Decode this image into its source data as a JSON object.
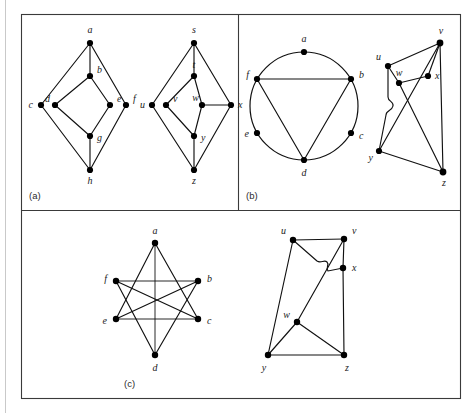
{
  "figure": {
    "panels": [
      {
        "id": "a",
        "label": "(a)"
      },
      {
        "id": "b",
        "label": "(b)"
      },
      {
        "id": "c",
        "label": "(c)"
      }
    ]
  },
  "panel_a": {
    "label": "(a)",
    "left_graph": {
      "name": "graph-a-left",
      "vertex_labels": [
        "a",
        "b",
        "c",
        "d",
        "e",
        "f",
        "g",
        "h"
      ],
      "vertices": [
        {
          "id": "a",
          "label": "a",
          "x": 90,
          "y": 43,
          "lx": 90,
          "ly": 33,
          "anchor": "middle"
        },
        {
          "id": "b",
          "label": "b",
          "x": 90,
          "y": 76,
          "lx": 97,
          "ly": 73,
          "anchor": "start"
        },
        {
          "id": "c",
          "label": "c",
          "x": 41,
          "y": 105,
          "lx": 33,
          "ly": 108,
          "anchor": "end"
        },
        {
          "id": "d",
          "label": "d",
          "x": 55,
          "y": 105,
          "lx": 48,
          "ly": 103,
          "anchor": "end"
        },
        {
          "id": "e",
          "label": "e",
          "x": 110,
          "y": 105,
          "lx": 117,
          "ly": 103,
          "anchor": "start"
        },
        {
          "id": "f",
          "label": "f",
          "x": 126,
          "y": 105,
          "lx": 133,
          "ly": 103,
          "anchor": "start"
        },
        {
          "id": "g",
          "label": "g",
          "x": 90,
          "y": 136,
          "lx": 97,
          "ly": 139,
          "anchor": "start"
        },
        {
          "id": "h",
          "label": "h",
          "x": 90,
          "y": 170,
          "lx": 90,
          "ly": 183,
          "anchor": "middle"
        }
      ],
      "edges": [
        [
          "a",
          "b"
        ],
        [
          "a",
          "c"
        ],
        [
          "a",
          "f"
        ],
        [
          "b",
          "d"
        ],
        [
          "b",
          "e"
        ],
        [
          "c",
          "h"
        ],
        [
          "f",
          "h"
        ],
        [
          "d",
          "g"
        ],
        [
          "e",
          "g"
        ],
        [
          "g",
          "h"
        ]
      ]
    },
    "right_graph": {
      "name": "graph-a-right",
      "vertex_labels": [
        "s",
        "t",
        "u",
        "v",
        "w",
        "x",
        "y",
        "z"
      ],
      "vertices": [
        {
          "id": "s",
          "label": "s",
          "x": 194,
          "y": 43,
          "lx": 194,
          "ly": 33,
          "anchor": "middle"
        },
        {
          "id": "t",
          "label": "t",
          "x": 194,
          "y": 76,
          "lx": 194,
          "ly": 68,
          "anchor": "middle"
        },
        {
          "id": "u",
          "label": "u",
          "x": 152,
          "y": 105,
          "lx": 144,
          "ly": 108,
          "anchor": "end"
        },
        {
          "id": "v",
          "label": "v",
          "x": 166,
          "y": 105,
          "lx": 173,
          "ly": 103,
          "anchor": "start"
        },
        {
          "id": "w",
          "label": "w",
          "x": 202,
          "y": 105,
          "lx": 199,
          "ly": 103,
          "anchor": "end"
        },
        {
          "id": "x",
          "label": "x",
          "x": 231,
          "y": 105,
          "lx": 238,
          "ly": 108,
          "anchor": "start"
        },
        {
          "id": "y",
          "label": "y",
          "x": 194,
          "y": 136,
          "lx": 201,
          "ly": 139,
          "anchor": "start"
        },
        {
          "id": "z",
          "label": "z",
          "x": 194,
          "y": 170,
          "lx": 194,
          "ly": 183,
          "anchor": "middle"
        }
      ],
      "edges": [
        [
          "s",
          "t"
        ],
        [
          "s",
          "u"
        ],
        [
          "s",
          "x"
        ],
        [
          "t",
          "v"
        ],
        [
          "t",
          "w"
        ],
        [
          "u",
          "z"
        ],
        [
          "x",
          "z"
        ],
        [
          "v",
          "y"
        ],
        [
          "w",
          "y"
        ],
        [
          "w",
          "x"
        ],
        [
          "y",
          "z"
        ]
      ]
    }
  },
  "panel_b": {
    "label": "(b)",
    "left_graph": {
      "name": "graph-b-left-circle",
      "shape": "circle",
      "circle": {
        "cx": 304,
        "cy": 106,
        "r": 54
      },
      "vertex_labels": [
        "a",
        "b",
        "c",
        "d",
        "e",
        "f"
      ],
      "vertices": [
        {
          "id": "a",
          "label": "a",
          "x": 304,
          "y": 52,
          "lx": 304,
          "ly": 43,
          "anchor": "middle"
        },
        {
          "id": "b",
          "label": "b",
          "x": 351,
          "y": 79,
          "lx": 359,
          "ly": 79,
          "anchor": "start"
        },
        {
          "id": "c",
          "label": "c",
          "x": 351,
          "y": 133,
          "lx": 359,
          "ly": 138,
          "anchor": "start"
        },
        {
          "id": "d",
          "label": "d",
          "x": 304,
          "y": 160,
          "lx": 304,
          "ly": 174,
          "anchor": "middle"
        },
        {
          "id": "e",
          "label": "e",
          "x": 257,
          "y": 133,
          "lx": 249,
          "ly": 136,
          "anchor": "end"
        },
        {
          "id": "f",
          "label": "f",
          "x": 257,
          "y": 79,
          "lx": 249,
          "ly": 79,
          "anchor": "end"
        }
      ],
      "edges": [
        [
          "f",
          "b"
        ],
        [
          "f",
          "d"
        ],
        [
          "b",
          "d"
        ]
      ]
    },
    "right_graph": {
      "name": "graph-b-right",
      "vertex_labels": [
        "u",
        "v",
        "w",
        "x",
        "y",
        "z"
      ],
      "vertices": [
        {
          "id": "u",
          "label": "u",
          "x": 388,
          "y": 66,
          "lx": 381,
          "ly": 60,
          "anchor": "end"
        },
        {
          "id": "v",
          "label": "v",
          "x": 440,
          "y": 43,
          "lx": 440,
          "ly": 34,
          "anchor": "middle"
        },
        {
          "id": "w",
          "label": "w",
          "x": 399,
          "y": 83,
          "lx": 398,
          "ly": 75,
          "anchor": "middle"
        },
        {
          "id": "x",
          "label": "x",
          "x": 428,
          "y": 76,
          "lx": 435,
          "ly": 79,
          "anchor": "start"
        },
        {
          "id": "y",
          "label": "y",
          "x": 379,
          "y": 151,
          "lx": 372,
          "ly": 158,
          "anchor": "end"
        },
        {
          "id": "z",
          "label": "z",
          "x": 443,
          "y": 172,
          "lx": 443,
          "ly": 185,
          "anchor": "middle"
        }
      ],
      "edges": [
        [
          "u",
          "v"
        ],
        [
          "u",
          "w"
        ],
        [
          "u",
          "y"
        ],
        [
          "v",
          "x"
        ],
        [
          "v",
          "z"
        ],
        [
          "v",
          "y"
        ],
        [
          "w",
          "x"
        ],
        [
          "w",
          "z"
        ],
        [
          "y",
          "z"
        ]
      ],
      "bridge_note": "u-y edge hops over w-z edge"
    }
  },
  "panel_c": {
    "label": "(c)",
    "left_graph": {
      "name": "graph-c-left-star",
      "vertex_labels": [
        "a",
        "b",
        "c",
        "d",
        "e",
        "f"
      ],
      "vertices": [
        {
          "id": "a",
          "label": "a",
          "x": 155,
          "y": 243,
          "lx": 155,
          "ly": 234,
          "anchor": "middle"
        },
        {
          "id": "b",
          "label": "b",
          "x": 198,
          "y": 281,
          "lx": 206,
          "ly": 281,
          "anchor": "start"
        },
        {
          "id": "c",
          "label": "c",
          "x": 198,
          "y": 319,
          "lx": 206,
          "ly": 322,
          "anchor": "start"
        },
        {
          "id": "d",
          "label": "d",
          "x": 155,
          "y": 355,
          "lx": 155,
          "ly": 369,
          "anchor": "middle"
        },
        {
          "id": "e",
          "label": "e",
          "x": 116,
          "y": 319,
          "lx": 108,
          "ly": 322,
          "anchor": "end"
        },
        {
          "id": "f",
          "label": "f",
          "x": 116,
          "y": 281,
          "lx": 108,
          "ly": 281,
          "anchor": "end"
        }
      ],
      "edges": [
        [
          "a",
          "c"
        ],
        [
          "a",
          "e"
        ],
        [
          "a",
          "d"
        ],
        [
          "b",
          "d"
        ],
        [
          "b",
          "f"
        ],
        [
          "b",
          "e"
        ],
        [
          "c",
          "e"
        ],
        [
          "c",
          "f"
        ],
        [
          "d",
          "f"
        ],
        [
          "f",
          "b"
        ]
      ]
    },
    "right_graph": {
      "name": "graph-c-right",
      "vertex_labels": [
        "u",
        "v",
        "w",
        "x",
        "y",
        "z"
      ],
      "vertices": [
        {
          "id": "u",
          "label": "u",
          "x": 293,
          "y": 240,
          "lx": 286,
          "ly": 234,
          "anchor": "end"
        },
        {
          "id": "v",
          "label": "v",
          "x": 344,
          "y": 239,
          "lx": 351,
          "ly": 234,
          "anchor": "start"
        },
        {
          "id": "w",
          "label": "w",
          "x": 297,
          "y": 322,
          "lx": 290,
          "ly": 318,
          "anchor": "end"
        },
        {
          "id": "x",
          "label": "x",
          "x": 343,
          "y": 268,
          "lx": 351,
          "ly": 268,
          "anchor": "start"
        },
        {
          "id": "y",
          "label": "y",
          "x": 268,
          "y": 355,
          "lx": 265,
          "ly": 369,
          "anchor": "middle"
        },
        {
          "id": "z",
          "label": "z",
          "x": 344,
          "y": 355,
          "lx": 346,
          "ly": 369,
          "anchor": "middle"
        }
      ],
      "edges": [
        [
          "u",
          "v"
        ],
        [
          "u",
          "y"
        ],
        [
          "u",
          "x"
        ],
        [
          "v",
          "x"
        ],
        [
          "v",
          "w"
        ],
        [
          "x",
          "z"
        ],
        [
          "w",
          "y"
        ],
        [
          "w",
          "z"
        ],
        [
          "y",
          "z"
        ]
      ],
      "bridge_note": "u-x edge hops over v-w edge"
    }
  },
  "colors": {
    "ink": "#111111",
    "frame": "#3a3a3a",
    "label": "#2b2b2b",
    "background": "#ffffff",
    "page_edge": "#c9c9c9"
  }
}
